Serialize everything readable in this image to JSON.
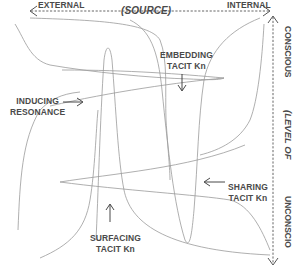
{
  "diagram": {
    "horizontal_axis": {
      "left_label": "EXTERNAL",
      "center_label": "(SOURCE)",
      "right_label": "INTERNAL",
      "style": "dashed double-headed arrow"
    },
    "vertical_axis": {
      "top_label": "CONSCIOUS",
      "center_label": "(LEVEL OF",
      "bottom_label": "UNCONSCIO",
      "style": "dashed double-headed arrow"
    },
    "processes": [
      {
        "id": "embedding",
        "line1": "EMBEDDING",
        "line2": "TACIT Kn",
        "arrow": "down"
      },
      {
        "id": "inducing",
        "line1": "INDUCING",
        "line2": "RESONANCE",
        "arrow": "right"
      },
      {
        "id": "sharing",
        "line1": "SHARING",
        "line2": "TACIT Kn",
        "arrow": "left"
      },
      {
        "id": "surfacing",
        "line1": "SURFACING",
        "line2": "TACIT Kn",
        "arrow": "up"
      }
    ],
    "colors": {
      "text": "#4a4a4a",
      "curve": "#9a9a9a",
      "axis": "#555555",
      "arrow": "#333333"
    }
  }
}
